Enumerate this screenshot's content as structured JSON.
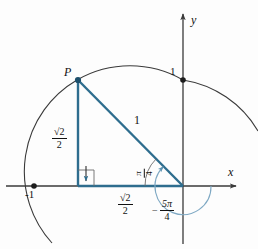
{
  "figure": {
    "background_color": "#fdfdfd",
    "curve_color": "#3a3a3a",
    "triangle_color": "#2e6d8e",
    "angle_arc_color": "#7fa9c4",
    "axes": {
      "x_label": "x",
      "y_label": "y",
      "x_tick_label": "-1",
      "y_tick_label": "1"
    },
    "point": {
      "label": "P",
      "x_pixel": 78,
      "y_pixel": 80
    },
    "labels": {
      "hypotenuse": "1",
      "vertical_leg_numerator": "√2",
      "vertical_leg_denominator": "2",
      "horizontal_leg_numerator": "√2",
      "horizontal_leg_denominator": "2",
      "acute_angle_numerator": "π",
      "acute_angle_denominator": "4",
      "rotation_angle_sign": "−",
      "rotation_angle_numerator": "5π",
      "rotation_angle_denominator": "4"
    },
    "geometry": {
      "origin_x": 183,
      "origin_y": 186,
      "radius": 106,
      "right_angle_marker": true,
      "right_angle_arrow": true
    }
  }
}
